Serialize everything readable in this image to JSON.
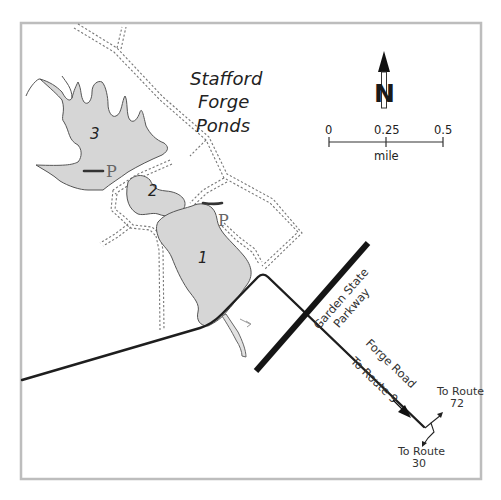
{
  "map": {
    "title": {
      "line1": "Stafford",
      "line2": "Forge",
      "line3": "Ponds"
    },
    "ponds": [
      {
        "id": "pond-3",
        "label": "3"
      },
      {
        "id": "pond-2",
        "label": "2"
      },
      {
        "id": "pond-1",
        "label": "1"
      }
    ],
    "parking": [
      {
        "id": "parking-north",
        "label": "P"
      },
      {
        "id": "parking-east",
        "label": "P"
      }
    ],
    "roads": {
      "parkway": {
        "line1": "Garden State",
        "line2": "Parkway"
      },
      "forge_road": "Forge Road",
      "to_route_9": "To Route 9"
    },
    "route_labels": {
      "route_72": {
        "line1": "To Route",
        "line2": "72"
      },
      "route_30": {
        "line1": "To Route",
        "line2": "30"
      }
    },
    "compass": {
      "letter": "N",
      "icon": "north-arrow-icon"
    },
    "scale": {
      "ticks": [
        "0",
        "0.25",
        "0.5"
      ],
      "unit": "mile"
    },
    "colors": {
      "pond_fill": "#d6d6d6",
      "frame": "#bdbdbd",
      "road": "#1e1e1e",
      "trail": "#777777"
    }
  }
}
